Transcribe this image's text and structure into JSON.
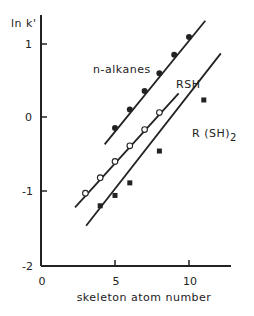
{
  "chart_data": {
    "type": "scatter",
    "title": "",
    "xlabel": "skeleton atom number",
    "ylabel": "ln k'",
    "xlim": [
      0,
      12.5
    ],
    "ylim": [
      -2,
      1.4
    ],
    "xticks": [
      0,
      5,
      10
    ],
    "yticks": [
      -2,
      -1,
      0,
      1
    ],
    "grid": false,
    "legend": "inline labels next to lines",
    "series": [
      {
        "name": "n-alkanes",
        "marker": "filled-circle",
        "x": [
          5,
          6,
          7,
          8,
          9,
          10
        ],
        "y": [
          -0.15,
          0.1,
          0.35,
          0.59,
          0.84,
          1.08
        ],
        "fit_line": {
          "x": [
            4.3,
            11.1
          ],
          "y": [
            -0.37,
            1.3
          ]
        }
      },
      {
        "name": "RSH",
        "marker": "open-circle",
        "x": [
          3,
          4,
          5,
          6,
          7,
          8
        ],
        "y": [
          -1.03,
          -0.82,
          -0.6,
          -0.39,
          -0.17,
          0.06
        ],
        "fit_line": {
          "x": [
            2.3,
            9.3
          ],
          "y": [
            -1.22,
            0.32
          ]
        }
      },
      {
        "name": "R (SH)2",
        "marker": "filled-square",
        "x": [
          4,
          5,
          6,
          8,
          11
        ],
        "y": [
          -1.2,
          -1.06,
          -0.89,
          -0.46,
          0.23
        ],
        "fit_line": {
          "x": [
            3.05,
            12.15
          ],
          "y": [
            -1.47,
            0.86
          ]
        }
      }
    ]
  },
  "labels": {
    "y_axis": "ln k'",
    "x_axis": "skeleton atom number",
    "series": {
      "n_alkanes": "n-alkanes",
      "rsh": "RSH",
      "rsh2_main": "R (SH)",
      "rsh2_sub": "2"
    },
    "x_ticks": [
      "0",
      "5",
      "10"
    ],
    "y_ticks": [
      "1",
      "0",
      "-1",
      "-2"
    ]
  }
}
